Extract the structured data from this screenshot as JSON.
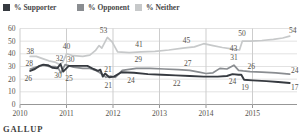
{
  "source": "GALLUP",
  "legend": {
    "items": [
      {
        "label": "% Supporter"
      },
      {
        "label": "% Opponent"
      },
      {
        "label": "% Neither"
      }
    ]
  },
  "colors": {
    "supporter": "#363a40",
    "opponent": "#8a8d91",
    "neither": "#c7c9ca",
    "grid_h": "#e2e2e2",
    "grid_v": "#cdcdcd",
    "axis": "#979797",
    "text": "#56524b"
  },
  "chart_data": {
    "type": "line",
    "title": "",
    "xlabel": "",
    "ylabel": "",
    "x_axis": {
      "ticks": [
        "2010",
        "2011",
        "2012",
        "2013",
        "2014",
        "2015"
      ],
      "range": [
        2010,
        2016
      ]
    },
    "y_axis": {
      "ticks": [
        "0",
        "10",
        "20",
        "30",
        "40",
        "50",
        "60"
      ],
      "range": [
        0,
        60
      ]
    },
    "grid": true,
    "legend_position": "top",
    "series": [
      {
        "name": "% Neither",
        "key": "neither",
        "points": [
          [
            2010.22,
            38
          ],
          [
            2010.35,
            38
          ],
          [
            2010.5,
            36
          ],
          [
            2010.62,
            34.5
          ],
          [
            2010.75,
            33.5
          ],
          [
            2010.85,
            31.5
          ],
          [
            2010.92,
            33.5
          ],
          [
            2011.0,
            40
          ],
          [
            2011.15,
            38.5
          ],
          [
            2011.35,
            38
          ],
          [
            2011.5,
            39
          ],
          [
            2011.62,
            42.5
          ],
          [
            2011.7,
            46.5
          ],
          [
            2011.76,
            44.5
          ],
          [
            2011.88,
            53
          ],
          [
            2011.98,
            49.5
          ],
          [
            2012.1,
            41.5
          ],
          [
            2012.35,
            41
          ],
          [
            2012.6,
            41.5
          ],
          [
            2012.9,
            42
          ],
          [
            2013.2,
            43
          ],
          [
            2013.5,
            44.5
          ],
          [
            2013.75,
            45.5
          ],
          [
            2013.95,
            48
          ],
          [
            2014.15,
            46.5
          ],
          [
            2014.35,
            45
          ],
          [
            2014.55,
            44
          ],
          [
            2014.72,
            43
          ],
          [
            2014.78,
            50
          ],
          [
            2014.95,
            50
          ],
          [
            2015.2,
            50.5
          ],
          [
            2015.45,
            51.5
          ],
          [
            2015.65,
            52.5
          ],
          [
            2015.8,
            54
          ]
        ],
        "labels": [
          {
            "text": "38",
            "year": 2010.22,
            "value": 38,
            "dx": 0,
            "dy": -2
          },
          {
            "text": "40",
            "year": 2011.0,
            "value": 40,
            "dx": 0,
            "dy": -5
          },
          {
            "text": "53",
            "year": 2011.88,
            "value": 53,
            "dx": -4,
            "dy": -4
          },
          {
            "text": "41",
            "year": 2012.6,
            "value": 41.5,
            "dx": -2,
            "dy": -5
          },
          {
            "text": "45",
            "year": 2013.6,
            "value": 45,
            "dx": -1,
            "dy": -5
          },
          {
            "text": "43",
            "year": 2014.72,
            "value": 43,
            "dx": -6,
            "dy": 1
          },
          {
            "text": "50",
            "year": 2014.82,
            "value": 50,
            "dx": -2,
            "dy": -5
          },
          {
            "text": "54",
            "year": 2015.8,
            "value": 54,
            "dx": 3,
            "dy": -3
          }
        ]
      },
      {
        "name": "% Opponent",
        "key": "opponent",
        "points": [
          [
            2010.22,
            28
          ],
          [
            2010.35,
            29.5
          ],
          [
            2010.5,
            31
          ],
          [
            2010.62,
            30
          ],
          [
            2010.75,
            30
          ],
          [
            2010.82,
            29
          ],
          [
            2010.88,
            25
          ],
          [
            2010.97,
            31.5
          ],
          [
            2011.15,
            29.5
          ],
          [
            2011.35,
            28.5
          ],
          [
            2011.5,
            28.5
          ],
          [
            2011.62,
            27
          ],
          [
            2011.7,
            25.5
          ],
          [
            2011.78,
            23.5
          ],
          [
            2011.85,
            21.5
          ],
          [
            2011.95,
            22.5
          ],
          [
            2012.05,
            21.5
          ],
          [
            2012.2,
            27
          ],
          [
            2012.5,
            28.5
          ],
          [
            2012.8,
            28.5
          ],
          [
            2013.1,
            28
          ],
          [
            2013.4,
            27.5
          ],
          [
            2013.65,
            27
          ],
          [
            2013.85,
            25.5
          ],
          [
            2014.0,
            24.5
          ],
          [
            2014.15,
            25
          ],
          [
            2014.3,
            28.5
          ],
          [
            2014.45,
            28
          ],
          [
            2014.6,
            31
          ],
          [
            2014.7,
            27
          ],
          [
            2014.8,
            26.5
          ],
          [
            2014.95,
            26
          ],
          [
            2015.2,
            25.5
          ],
          [
            2015.5,
            25
          ],
          [
            2015.8,
            24
          ]
        ],
        "labels": [
          {
            "text": "28",
            "year": 2010.22,
            "value": 28,
            "dx": -1,
            "dy": -3
          },
          {
            "text": "30",
            "year": 2010.75,
            "value": 30,
            "dx": 3,
            "dy": 11
          },
          {
            "text": "25",
            "year": 2010.88,
            "value": 25,
            "dx": 8,
            "dy": 8
          },
          {
            "text": "21",
            "year": 2011.85,
            "value": 21.5,
            "dx": 2,
            "dy": -5
          },
          {
            "text": "29",
            "year": 2012.5,
            "value": 28.5,
            "dx": 2,
            "dy": -6
          },
          {
            "text": "27",
            "year": 2013.65,
            "value": 27,
            "dx": -2,
            "dy": -4
          },
          {
            "text": "31",
            "year": 2014.6,
            "value": 31,
            "dx": 0,
            "dy": -5
          },
          {
            "text": "26",
            "year": 2014.95,
            "value": 26,
            "dx": 1,
            "dy": -3
          },
          {
            "text": "24",
            "year": 2015.8,
            "value": 24,
            "dx": 5,
            "dy": -1
          }
        ]
      },
      {
        "name": "% Supporter",
        "key": "supporter",
        "points": [
          [
            2010.22,
            26.5
          ],
          [
            2010.32,
            28
          ],
          [
            2010.42,
            30.5
          ],
          [
            2010.5,
            31.5
          ],
          [
            2010.6,
            31
          ],
          [
            2010.7,
            29
          ],
          [
            2010.8,
            28.5
          ],
          [
            2010.87,
            32
          ],
          [
            2010.93,
            26
          ],
          [
            2011.05,
            30.5
          ],
          [
            2011.25,
            30.5
          ],
          [
            2011.45,
            30.5
          ],
          [
            2011.58,
            28
          ],
          [
            2011.68,
            26.5
          ],
          [
            2011.73,
            27.5
          ],
          [
            2011.78,
            22
          ],
          [
            2011.83,
            24.5
          ],
          [
            2011.92,
            21.5
          ],
          [
            2012.02,
            22
          ],
          [
            2012.18,
            25.5
          ],
          [
            2012.45,
            25
          ],
          [
            2012.75,
            24
          ],
          [
            2013.05,
            23.5
          ],
          [
            2013.35,
            23
          ],
          [
            2013.65,
            22.5
          ],
          [
            2013.95,
            22
          ],
          [
            2014.25,
            22
          ],
          [
            2014.45,
            22.5
          ],
          [
            2014.57,
            24
          ],
          [
            2014.7,
            23.5
          ],
          [
            2014.76,
            23.5
          ],
          [
            2014.82,
            19.5
          ],
          [
            2015.0,
            19
          ],
          [
            2015.3,
            18.5
          ],
          [
            2015.55,
            17.8
          ],
          [
            2015.8,
            17
          ]
        ],
        "labels": [
          {
            "text": "26",
            "year": 2010.22,
            "value": 26.5,
            "dx": -2,
            "dy": 10
          },
          {
            "text": "32",
            "year": 2010.87,
            "value": 32,
            "dx": -1,
            "dy": -3
          },
          {
            "text": "30",
            "year": 2011.05,
            "value": 30.5,
            "dx": 2,
            "dy": -4
          },
          {
            "text": "21",
            "year": 2011.92,
            "value": 21.5,
            "dx": -1,
            "dy": 11
          },
          {
            "text": "24",
            "year": 2012.45,
            "value": 25,
            "dx": -3,
            "dy": 10
          },
          {
            "text": "22",
            "year": 2013.5,
            "value": 22.8,
            "dx": -6,
            "dy": 10
          },
          {
            "text": "24",
            "year": 2014.57,
            "value": 24,
            "dx": 0,
            "dy": 10
          },
          {
            "text": "19",
            "year": 2014.82,
            "value": 19.5,
            "dx": 1,
            "dy": 10
          },
          {
            "text": "17",
            "year": 2015.8,
            "value": 17,
            "dx": 5,
            "dy": 7
          }
        ]
      }
    ]
  }
}
